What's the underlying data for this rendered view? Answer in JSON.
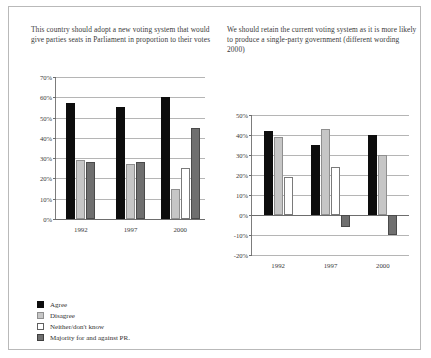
{
  "figure": {
    "legend": [
      {
        "key": "agree",
        "label": "Agree",
        "color": "#0d0d0d"
      },
      {
        "key": "disagree",
        "label": "Disagree",
        "color": "#c6c6c6"
      },
      {
        "key": "neither",
        "label": "Neither/don't know",
        "color": "#ffffff"
      },
      {
        "key": "pr",
        "label": "Majority for and against PR.",
        "color": "#6f6f6f"
      }
    ]
  },
  "chart_data": [
    {
      "type": "bar",
      "id": "left",
      "title": "This country should adopt a new voting system that would give parties seats in Parliament in proportion to their votes",
      "categories": [
        "1992",
        "1997",
        "2000"
      ],
      "series": [
        {
          "name": "Agree",
          "key": "agree",
          "values": [
            57,
            55,
            60
          ]
        },
        {
          "name": "Disagree",
          "key": "disagree",
          "values": [
            29,
            27,
            15
          ]
        },
        {
          "name": "Neither/don't know",
          "key": "neither",
          "values": [
            null,
            null,
            25
          ]
        },
        {
          "name": "Majority for and against PR.",
          "key": "pr",
          "values": [
            28,
            28,
            45
          ]
        }
      ],
      "xlabel": "",
      "ylabel": "",
      "ylim": [
        0,
        70
      ],
      "yticks": [
        "70%",
        "60%",
        "50%",
        "40%",
        "30%",
        "20%",
        "10%",
        "0%"
      ],
      "grid": true,
      "legend_position": "below"
    },
    {
      "type": "bar",
      "id": "right",
      "title": "We should retain the current voting system as it is more likely to produce a single-party government (different wording 2000)",
      "categories": [
        "1992",
        "1997",
        "2000"
      ],
      "series": [
        {
          "name": "Agree",
          "key": "agree",
          "values": [
            42,
            35,
            40
          ]
        },
        {
          "name": "Disagree",
          "key": "disagree",
          "values": [
            39,
            43,
            30
          ]
        },
        {
          "name": "Neither/don't know",
          "key": "neither",
          "values": [
            19,
            24,
            null
          ]
        },
        {
          "name": "Majority for and against PR.",
          "key": "pr",
          "values": [
            null,
            -6,
            -10
          ]
        }
      ],
      "xlabel": "",
      "ylabel": "",
      "ylim": [
        -20,
        50
      ],
      "yticks": [
        "50%",
        "40%",
        "30%",
        "20%",
        "10%",
        "0%",
        "-10%",
        "-20%"
      ],
      "grid": true,
      "legend_position": "below"
    }
  ]
}
